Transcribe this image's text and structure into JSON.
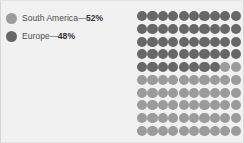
{
  "colors": {
    "background": "#f1f1f1",
    "dark": "#676767",
    "light": "#9b9b9b",
    "text": "#4b4b4b",
    "percent_text": "#333333"
  },
  "legend": {
    "items": [
      {
        "label": "South America",
        "separator": "—",
        "percent": "52%",
        "swatch": "light-gray-circle",
        "color": "#9b9b9b",
        "value": 52
      },
      {
        "label": "Europe",
        "separator": "—",
        "percent": "48%",
        "swatch": "dark-gray-circle",
        "color": "#676767",
        "value": 48
      }
    ]
  },
  "chart_data": {
    "type": "pie",
    "subtype": "waffle",
    "title": "",
    "xlabel": "",
    "ylabel": "",
    "categories": [
      "Europe",
      "South America"
    ],
    "values": [
      48,
      52
    ],
    "unit": "%",
    "total_dots": 100,
    "grid": {
      "columns": 10,
      "rows": 10,
      "fill_order": "row-major-left-to-right"
    },
    "series": [
      {
        "name": "Europe",
        "value": 48,
        "color": "#676767",
        "dots": 48
      },
      {
        "name": "South America",
        "value": 52,
        "color": "#9b9b9b",
        "dots": 52
      }
    ],
    "legend_position": "left"
  }
}
